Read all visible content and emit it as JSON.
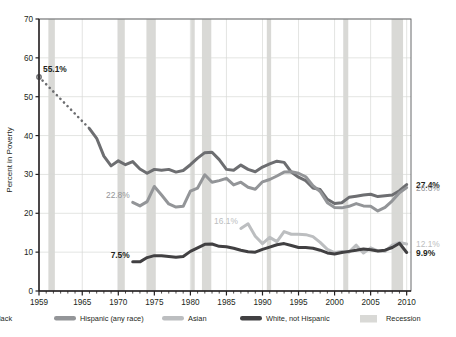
{
  "chart_data": {
    "type": "line",
    "title": "",
    "subtitle": "",
    "xlabel": "",
    "ylabel": "Percent in Poverty",
    "xlim": [
      1959,
      2010.6
    ],
    "ylim": [
      0,
      70
    ],
    "y_ticks": [
      0,
      10,
      20,
      30,
      40,
      50,
      60,
      70
    ],
    "x_ticks": [
      1959,
      1965,
      1970,
      1975,
      1980,
      1985,
      1990,
      1995,
      2000,
      2005,
      2010
    ],
    "x_minor_tick_step": 1,
    "grid": true,
    "legend_position": "bottom",
    "series": [
      {
        "name": "Black",
        "color": "#6d6e71",
        "linewidth": 3.0,
        "dotted_segment": {
          "x": [
            1959,
            1966
          ],
          "y": [
            55.1,
            41.8
          ],
          "note": "interpolated / dotted connector between 1959 point and 1966 data start"
        },
        "x": [
          1966,
          1967,
          1968,
          1969,
          1970,
          1971,
          1972,
          1973,
          1974,
          1975,
          1976,
          1977,
          1978,
          1979,
          1980,
          1981,
          1982,
          1983,
          1984,
          1985,
          1986,
          1987,
          1988,
          1989,
          1990,
          1991,
          1992,
          1993,
          1994,
          1995,
          1996,
          1997,
          1998,
          1999,
          2000,
          2001,
          2002,
          2003,
          2004,
          2005,
          2006,
          2007,
          2008,
          2009,
          2010
        ],
        "y": [
          41.8,
          39.3,
          34.7,
          32.2,
          33.5,
          32.5,
          33.3,
          31.4,
          30.3,
          31.3,
          31.1,
          31.3,
          30.6,
          31.0,
          32.5,
          34.2,
          35.6,
          35.7,
          33.8,
          31.3,
          31.1,
          32.4,
          31.3,
          30.7,
          31.9,
          32.7,
          33.4,
          33.1,
          30.6,
          29.3,
          28.4,
          26.5,
          26.1,
          23.6,
          22.5,
          22.7,
          24.1,
          24.4,
          24.7,
          24.9,
          24.3,
          24.5,
          24.7,
          25.8,
          27.4
        ],
        "start_label": "55.1%",
        "end_label": "27.4%"
      },
      {
        "name": "Hispanic (any race)",
        "color": "#939598",
        "linewidth": 3.0,
        "x": [
          1972,
          1973,
          1974,
          1975,
          1976,
          1977,
          1978,
          1979,
          1980,
          1981,
          1982,
          1983,
          1984,
          1985,
          1986,
          1987,
          1988,
          1989,
          1990,
          1991,
          1992,
          1993,
          1994,
          1995,
          1996,
          1997,
          1998,
          1999,
          2000,
          2001,
          2002,
          2003,
          2004,
          2005,
          2006,
          2007,
          2008,
          2009,
          2010
        ],
        "y": [
          22.8,
          21.9,
          23.0,
          26.9,
          24.7,
          22.4,
          21.6,
          21.8,
          25.7,
          26.5,
          29.9,
          28.0,
          28.4,
          29.0,
          27.3,
          28.0,
          26.7,
          26.2,
          28.1,
          28.7,
          29.6,
          30.6,
          30.7,
          30.3,
          29.4,
          27.1,
          25.6,
          22.7,
          21.5,
          21.4,
          21.8,
          22.5,
          21.9,
          21.8,
          20.6,
          21.5,
          23.2,
          25.3,
          26.6
        ],
        "start_label": "22.8%",
        "end_label": "26.6%"
      },
      {
        "name": "Asian",
        "color": "#bcbec0",
        "linewidth": 3.0,
        "x": [
          1987,
          1988,
          1989,
          1990,
          1991,
          1992,
          1993,
          1994,
          1995,
          1996,
          1997,
          1998,
          1999,
          2000,
          2001,
          2002,
          2003,
          2004,
          2005,
          2006,
          2007,
          2008,
          2009,
          2010
        ],
        "y": [
          16.1,
          17.3,
          14.1,
          12.2,
          13.8,
          12.7,
          15.3,
          14.6,
          14.6,
          14.5,
          14.0,
          12.5,
          10.7,
          9.9,
          10.2,
          10.0,
          11.8,
          9.8,
          11.1,
          10.3,
          10.2,
          11.8,
          12.5,
          12.1
        ],
        "start_label": "16.1%",
        "end_label": "12.1%"
      },
      {
        "name": "White, not Hispanic",
        "color": "#414042",
        "linewidth": 3.0,
        "x": [
          1972,
          1973,
          1974,
          1975,
          1976,
          1977,
          1978,
          1979,
          1980,
          1981,
          1982,
          1983,
          1984,
          1985,
          1986,
          1987,
          1988,
          1989,
          1990,
          1991,
          1992,
          1993,
          1994,
          1995,
          1996,
          1997,
          1998,
          1999,
          2000,
          2001,
          2002,
          2003,
          2004,
          2005,
          2006,
          2007,
          2008,
          2009,
          2010
        ],
        "y": [
          7.5,
          7.5,
          8.6,
          9.1,
          9.1,
          8.9,
          8.7,
          8.9,
          10.2,
          11.1,
          12.0,
          12.1,
          11.5,
          11.4,
          11.0,
          10.5,
          10.1,
          10.0,
          10.7,
          11.3,
          11.9,
          12.2,
          11.7,
          11.2,
          11.2,
          11.0,
          10.5,
          9.8,
          9.5,
          9.9,
          10.2,
          10.5,
          10.8,
          10.6,
          10.3,
          10.5,
          11.2,
          12.3,
          9.9
        ],
        "start_label": "7.5%",
        "end_label": "9.9%"
      }
    ],
    "recession_bands": [
      {
        "start": 1960.3,
        "end": 1961.2
      },
      {
        "start": 1969.9,
        "end": 1970.9
      },
      {
        "start": 1973.9,
        "end": 1975.2
      },
      {
        "start": 1980.1,
        "end": 1980.6
      },
      {
        "start": 1981.6,
        "end": 1982.9
      },
      {
        "start": 1990.6,
        "end": 1991.2
      },
      {
        "start": 2001.2,
        "end": 2001.9
      },
      {
        "start": 2007.9,
        "end": 2009.5
      }
    ],
    "recession_color": "#d9d9d6",
    "annotations": [
      {
        "text": "55.1%",
        "series": "Black",
        "position": "left",
        "bold": true,
        "color": "#231f20"
      },
      {
        "text": "22.8%",
        "series": "Hispanic (any race)",
        "position": "left",
        "bold": false,
        "color": "#939598"
      },
      {
        "text": "16.1%",
        "series": "Asian",
        "position": "left",
        "bold": false,
        "color": "#bcbec0"
      },
      {
        "text": "7.5%",
        "series": "White, not Hispanic",
        "position": "left",
        "bold": true,
        "color": "#231f20"
      },
      {
        "text": "27.4%",
        "series": "Black",
        "position": "right",
        "bold": true,
        "color": "#231f20"
      },
      {
        "text": "26.6%",
        "series": "Hispanic (any race)",
        "position": "right",
        "bold": false,
        "color": "#939598"
      },
      {
        "text": "12.1%",
        "series": "Asian",
        "position": "right",
        "bold": false,
        "color": "#bcbec0"
      },
      {
        "text": "9.9%",
        "series": "White, not Hispanic",
        "position": "right",
        "bold": true,
        "color": "#231f20"
      }
    ]
  },
  "axes": {
    "y_axis_title": "Percent in Poverty",
    "y_tick_labels": [
      "70",
      "60",
      "50",
      "40",
      "30",
      "20",
      "10",
      "0"
    ],
    "x_tick_labels": [
      "1959",
      "1965",
      "1970",
      "1975",
      "1980",
      "1985",
      "1990",
      "1995",
      "2000",
      "2005",
      "2010"
    ]
  },
  "legend": {
    "items": [
      {
        "label": "Black",
        "color": "#6d6e71",
        "swatch": "line"
      },
      {
        "label": "Hispanic (any race)",
        "color": "#939598",
        "swatch": "line"
      },
      {
        "label": "Asian",
        "color": "#bcbec0",
        "swatch": "line"
      },
      {
        "label": "White, not Hispanic",
        "color": "#414042",
        "swatch": "line"
      },
      {
        "label": "Recession",
        "color": "#d9d9d6",
        "swatch": "band"
      }
    ]
  },
  "annotation_values": {
    "black_start": "55.1%",
    "hispanic_start": "22.8%",
    "asian_start": "16.1%",
    "white_start": "7.5%",
    "black_end": "27.4%",
    "hispanic_end": "26.6%",
    "asian_end": "12.1%",
    "white_end": "9.9%"
  },
  "colors": {
    "black_series": "#6d6e71",
    "hispanic_series": "#939598",
    "asian_series": "#bcbec0",
    "white_series": "#414042",
    "recession_band": "#d9d9d6",
    "grid": "#d7d8d6",
    "axis": "#231f20",
    "background": "#ffffff"
  }
}
